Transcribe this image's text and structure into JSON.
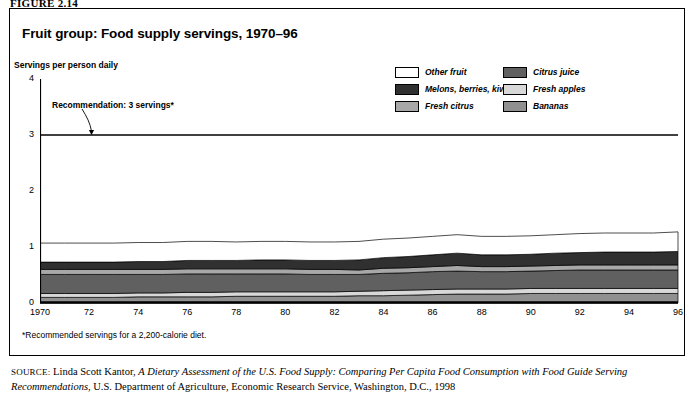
{
  "figure": {
    "label": "FIGURE 2.14"
  },
  "chart_title": "Fruit group: Food supply servings, 1970–96",
  "y_axis_title": "Servings per person daily",
  "annotation": {
    "recommendation_text": "Recommendation: 3 servings*",
    "recommendation_value": 3
  },
  "footnote": "*Recommended servings for a 2,200-calorie diet.",
  "source": {
    "label": "SOURCE:",
    "author": "Linda Scott Kantor,",
    "title_italic": "A Dietary Assessment of the U.S. Food Supply: Comparing Per Capita Food Consumption with Food Guide Serving Recommendations,",
    "publisher": "U.S. Department of Agriculture, Economic Research Service, Washington, D.C., 1998"
  },
  "legend": {
    "left_column": [
      {
        "label": "Other fruit",
        "color": "#ffffff",
        "key": "other_fruit"
      },
      {
        "label": "Melons, berries, kiwi",
        "color": "#303030",
        "key": "melons_berries_kiwi"
      },
      {
        "label": "Fresh citrus",
        "color": "#a8a8a8",
        "key": "fresh_citrus"
      }
    ],
    "right_column": [
      {
        "label": "Citrus juice",
        "color": "#606060",
        "key": "citrus_juice"
      },
      {
        "label": "Fresh apples",
        "color": "#d8d8d8",
        "key": "fresh_apples"
      },
      {
        "label": "Bananas",
        "color": "#909090",
        "key": "bananas"
      }
    ]
  },
  "chart_data": {
    "type": "area",
    "stacked": true,
    "title": "Fruit group: Food supply servings, 1970–96",
    "xlabel": "",
    "ylabel": "Servings per person daily",
    "xlim": [
      1970,
      1996
    ],
    "ylim": [
      0,
      4
    ],
    "yticks": [
      0,
      1,
      2,
      3,
      4
    ],
    "grid": false,
    "legend_position": "top-right",
    "x": [
      1970,
      1971,
      1972,
      1973,
      1974,
      1975,
      1976,
      1977,
      1978,
      1979,
      1980,
      1981,
      1982,
      1983,
      1984,
      1985,
      1986,
      1987,
      1988,
      1989,
      1990,
      1991,
      1992,
      1993,
      1994,
      1995,
      1996
    ],
    "xtick_labels": [
      "1970",
      "72",
      "74",
      "76",
      "78",
      "80",
      "82",
      "84",
      "86",
      "88",
      "90",
      "92",
      "94",
      "96"
    ],
    "xtick_values": [
      1970,
      1972,
      1974,
      1976,
      1978,
      1980,
      1982,
      1984,
      1986,
      1988,
      1990,
      1992,
      1994,
      1996
    ],
    "series": [
      {
        "name": "Bananas",
        "color": "#909090",
        "values": [
          0.1,
          0.1,
          0.1,
          0.1,
          0.11,
          0.11,
          0.11,
          0.11,
          0.12,
          0.12,
          0.12,
          0.12,
          0.12,
          0.13,
          0.13,
          0.14,
          0.15,
          0.16,
          0.16,
          0.16,
          0.17,
          0.17,
          0.17,
          0.17,
          0.17,
          0.17,
          0.17
        ]
      },
      {
        "name": "Fresh apples",
        "color": "#d8d8d8",
        "values": [
          0.07,
          0.07,
          0.07,
          0.07,
          0.07,
          0.07,
          0.08,
          0.08,
          0.08,
          0.08,
          0.08,
          0.08,
          0.08,
          0.08,
          0.09,
          0.09,
          0.09,
          0.09,
          0.09,
          0.09,
          0.09,
          0.09,
          0.09,
          0.09,
          0.09,
          0.09,
          0.09
        ]
      },
      {
        "name": "Citrus juice",
        "color": "#606060",
        "values": [
          0.34,
          0.34,
          0.34,
          0.34,
          0.33,
          0.33,
          0.33,
          0.33,
          0.32,
          0.32,
          0.32,
          0.31,
          0.31,
          0.3,
          0.31,
          0.31,
          0.32,
          0.32,
          0.31,
          0.31,
          0.31,
          0.32,
          0.33,
          0.33,
          0.33,
          0.33,
          0.33
        ]
      },
      {
        "name": "Fresh citrus",
        "color": "#a8a8a8",
        "values": [
          0.09,
          0.09,
          0.09,
          0.09,
          0.09,
          0.09,
          0.09,
          0.09,
          0.09,
          0.09,
          0.09,
          0.09,
          0.09,
          0.08,
          0.09,
          0.09,
          0.09,
          0.1,
          0.09,
          0.09,
          0.09,
          0.09,
          0.09,
          0.09,
          0.09,
          0.09,
          0.09
        ]
      },
      {
        "name": "Melons, berries, kiwi",
        "color": "#303030",
        "values": [
          0.13,
          0.13,
          0.13,
          0.13,
          0.14,
          0.14,
          0.15,
          0.15,
          0.15,
          0.16,
          0.16,
          0.16,
          0.16,
          0.18,
          0.19,
          0.2,
          0.21,
          0.22,
          0.21,
          0.21,
          0.21,
          0.22,
          0.22,
          0.23,
          0.23,
          0.23,
          0.24
        ]
      },
      {
        "name": "Other fruit",
        "color": "#ffffff",
        "values": [
          0.34,
          0.34,
          0.34,
          0.34,
          0.34,
          0.34,
          0.34,
          0.34,
          0.33,
          0.33,
          0.33,
          0.33,
          0.33,
          0.33,
          0.33,
          0.33,
          0.33,
          0.33,
          0.33,
          0.33,
          0.33,
          0.33,
          0.34,
          0.34,
          0.34,
          0.34,
          0.35
        ]
      }
    ],
    "totals": [
      1.07,
      1.07,
      1.07,
      1.07,
      1.08,
      1.08,
      1.1,
      1.1,
      1.09,
      1.1,
      1.1,
      1.09,
      1.09,
      1.1,
      1.14,
      1.16,
      1.19,
      1.22,
      1.19,
      1.19,
      1.2,
      1.22,
      1.24,
      1.25,
      1.25,
      1.25,
      1.27
    ],
    "reference_line": {
      "label": "Recommendation: 3 servings*",
      "value": 3
    }
  }
}
